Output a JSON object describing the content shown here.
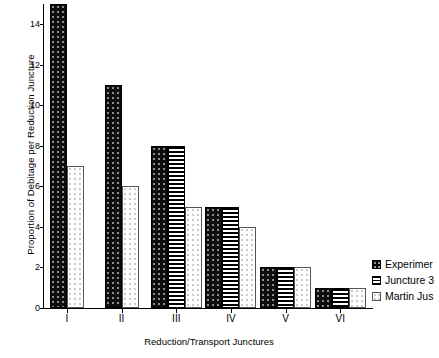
{
  "chart_data": {
    "type": "bar",
    "title": "",
    "xlabel": "Reduction/Transport Junctures",
    "ylabel": "Proportion of Debitage per Reduction Juncture",
    "categories": [
      "I",
      "II",
      "III",
      "IV",
      "V",
      "VI"
    ],
    "ylim": [
      0,
      15
    ],
    "yticks": [
      0,
      2,
      4,
      6,
      8,
      10,
      12,
      14
    ],
    "grid": false,
    "legend_position": "right",
    "series": [
      {
        "name": "Experimer",
        "pattern": "solid-black-dotted",
        "values": [
          15,
          11,
          8,
          5,
          2,
          1
        ]
      },
      {
        "name": "Juncture 3",
        "pattern": "horizontal-hatch",
        "values": [
          null,
          null,
          8,
          5,
          2,
          1
        ]
      },
      {
        "name": "Martin Jus",
        "pattern": "white-dotted",
        "values": [
          7,
          6,
          5,
          4,
          2,
          1
        ]
      }
    ]
  },
  "colors": {
    "axis": "#000000",
    "series_0": "#0d0d0d",
    "series_1": "#ffffff",
    "series_2": "#ffffff",
    "background": "#ffffff"
  }
}
